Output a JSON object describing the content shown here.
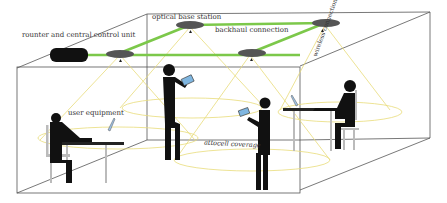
{
  "diagram": {
    "type": "indoor optical attocell network illustration",
    "labels": {
      "router": "rounter and central control unit",
      "base_station": "optical base station",
      "backhaul": "backhaul connection",
      "wireless": "wireless connection",
      "user_equipment": "user equipment",
      "coverage": "attocell coverage"
    },
    "colors": {
      "backhaul_line": "#7cc84a",
      "coverage_cone": "#e8dc7a",
      "base_station": "#555555",
      "silhouette": "#0d0d0d",
      "device_screen": "#7fb6e0",
      "room_edges": "#555555"
    },
    "nodes": [
      {
        "id": "router",
        "x": 65,
        "y": 55
      },
      {
        "id": "bs1",
        "x": 120,
        "y": 53
      },
      {
        "id": "bs2",
        "x": 190,
        "y": 25
      },
      {
        "id": "bs3",
        "x": 250,
        "y": 53
      },
      {
        "id": "bs4",
        "x": 325,
        "y": 23
      }
    ],
    "users": [
      {
        "pose": "seated with laptop",
        "x": 70
      },
      {
        "pose": "standing with tablet",
        "x": 168
      },
      {
        "pose": "standing with tablet",
        "x": 265
      },
      {
        "pose": "seated with laptop",
        "x": 345
      }
    ]
  }
}
